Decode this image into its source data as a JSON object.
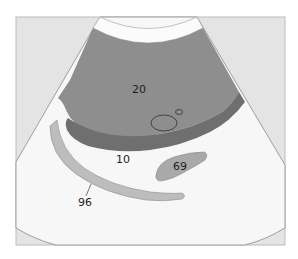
{
  "diagram": {
    "type": "ultrasound-schematic",
    "labels": {
      "region_large": "20",
      "region_band": "10",
      "region_small": "69",
      "region_curved": "96"
    },
    "colors": {
      "frame_bg": "#e4e4e4",
      "sector_bg": "#f7f7f7",
      "near_field_band": "#fbfbfb",
      "large_region": "#8e8e8e",
      "dark_band": "#6f6f6f",
      "small_region": "#a9a9a9",
      "curved_structure": "#bdbdbd",
      "outline": "#555555",
      "frame_border": "#bcbcbc"
    }
  }
}
